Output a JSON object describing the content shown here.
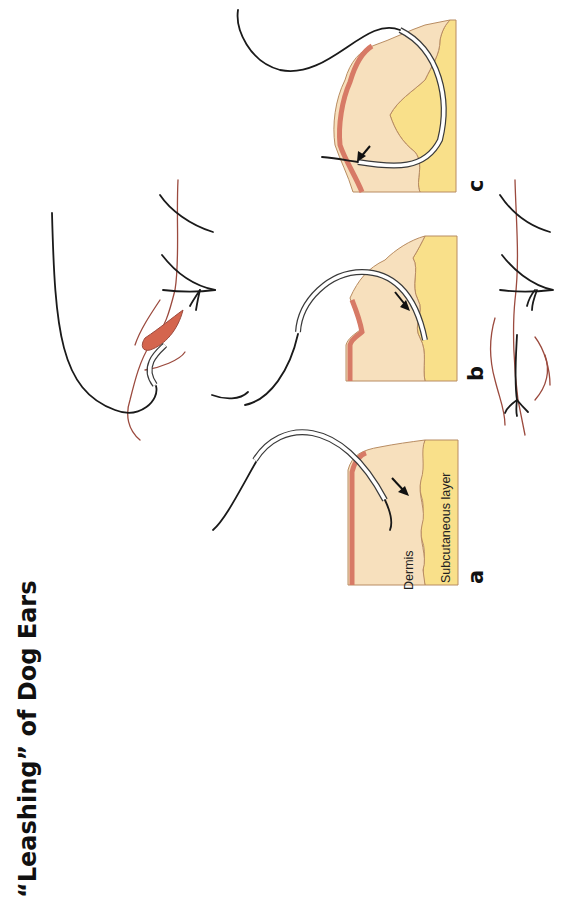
{
  "title": "“Leashing” of Dog Ears",
  "colors": {
    "dermis": "#f7e0bd",
    "subcutaneous": "#f9e08a",
    "epidermis": "#d77a66",
    "outline": "#b88c62",
    "thread": "#1a1a1a",
    "skin_line": "#9b4a3e",
    "dog_ear": "#d4654e"
  },
  "panels": [
    {
      "id": "a",
      "letter": "a",
      "labels": {
        "dermis": "Dermis",
        "subcutaneous": "Subcutaneous layer"
      },
      "arrow": "needle direction along dermis"
    },
    {
      "id": "b",
      "letter": "b",
      "arrow": "needle direction into subcutaneous layer"
    },
    {
      "id": "c",
      "letter": "c",
      "arrow": "needle exiting toward epidermis"
    }
  ],
  "schematics": {
    "top": "dog ear with leashing suture being placed",
    "bottom": "closed wound with completed leashing suture"
  }
}
